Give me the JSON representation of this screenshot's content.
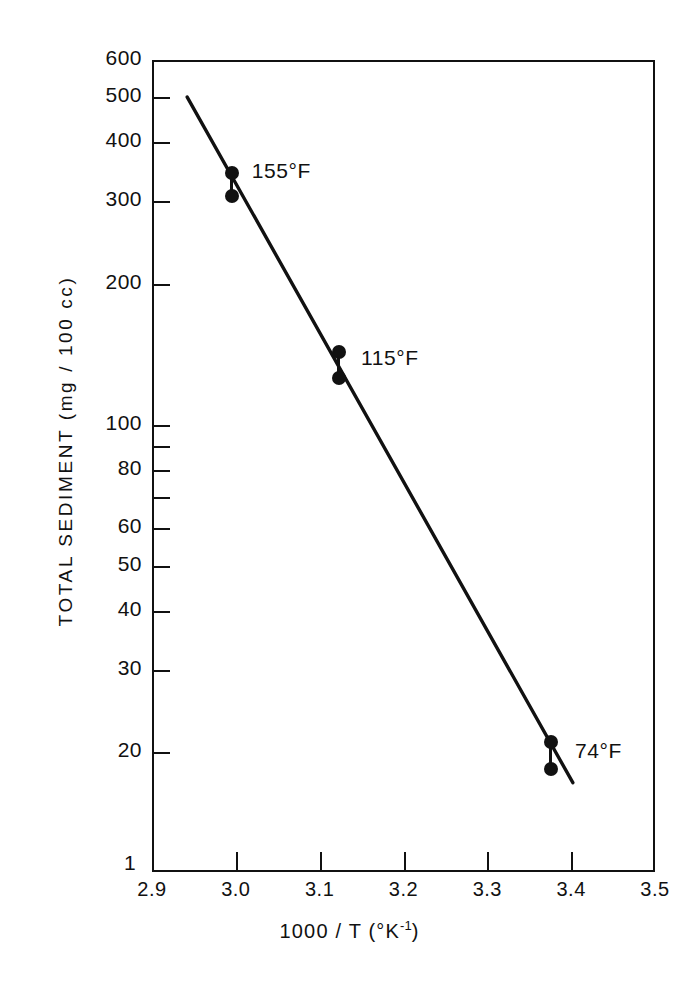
{
  "figure": {
    "background_color": "#ffffff",
    "ink_color": "#111111"
  },
  "chart_data": {
    "type": "scatter",
    "title": "",
    "subtitle": "",
    "xlabel": "1000 / T (°K⁻¹)",
    "ylabel": "TOTAL SEDIMENT  (mg / 100 cc)",
    "xlabel_parts": {
      "main": "1000 / T  (°K",
      "exponent": "-1",
      "tail": ")"
    },
    "xscale": "linear",
    "yscale": "log",
    "xlim": [
      2.9,
      3.5
    ],
    "ylim": [
      10,
      600
    ],
    "grid": false,
    "legend": "none",
    "frame": "box",
    "xticks": [
      2.9,
      3.0,
      3.1,
      3.2,
      3.3,
      3.4,
      3.5
    ],
    "xtick_labels": [
      "2.9",
      "3.0",
      "3.1",
      "3.2",
      "3.3",
      "3.4",
      "3.5"
    ],
    "yticks": [
      600,
      500,
      400,
      300,
      200,
      100,
      90,
      80,
      70,
      60,
      50,
      40,
      30,
      20
    ],
    "ytick_labels": [
      "600",
      "500",
      "400",
      "300",
      "200",
      "100",
      "",
      "80",
      "",
      "60",
      "50",
      "40",
      "30",
      "20"
    ],
    "y_axis_origin_label": "1",
    "fit_line": {
      "label": "least-squares fit",
      "x_start": 2.942,
      "y_start": 500,
      "x_end": 3.402,
      "y_end": 17.2
    },
    "series": [
      {
        "name": "155°F",
        "annotation": "155°F",
        "x": 2.995,
        "values": [
          345,
          308
        ],
        "marker": "filled-circle"
      },
      {
        "name": "115°F",
        "annotation": "115°F",
        "x": 3.123,
        "values": [
          143,
          126
        ],
        "marker": "filled-circle"
      },
      {
        "name": "74°F",
        "annotation": "74°F",
        "x": 3.376,
        "values": [
          21,
          18.4
        ],
        "marker": "filled-circle"
      }
    ]
  }
}
